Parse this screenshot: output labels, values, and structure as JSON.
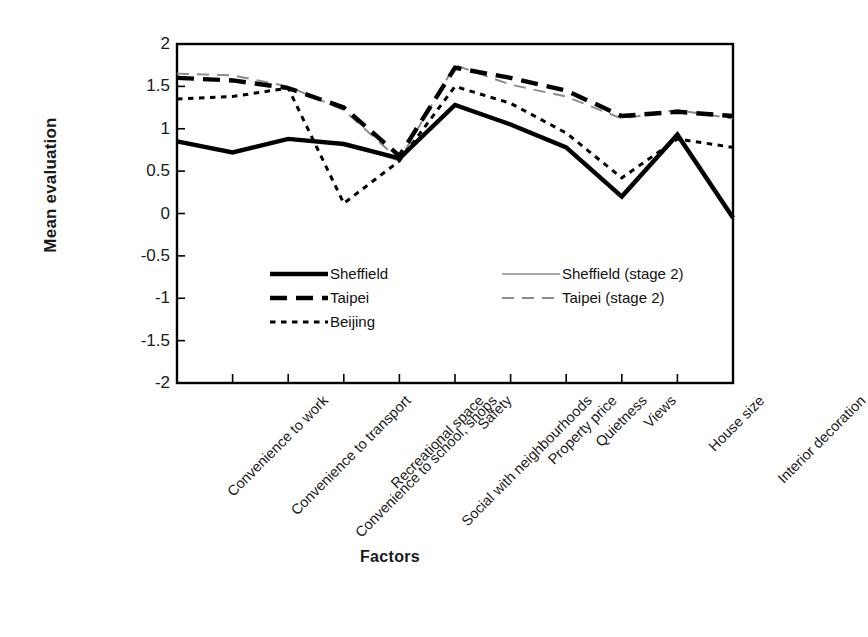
{
  "chart_data": {
    "type": "line",
    "title": "",
    "xlabel": "Factors",
    "ylabel": "Mean evaluation",
    "ylim": [
      -2,
      2
    ],
    "ytick_labels": [
      "2",
      "1.5",
      "1",
      "0.5",
      "0",
      "-0.5",
      "-1",
      "-1.5",
      "-2"
    ],
    "ytick_values": [
      2,
      1.5,
      1,
      0.5,
      0,
      -0.5,
      -1,
      -1.5,
      -2
    ],
    "grid": false,
    "legend_position": "inside-center",
    "categories": [
      "Convenience to work",
      "Convenience to transport",
      "Convenience to school, shops",
      "Recreational space",
      "Social with neighbourhoods",
      "Safety",
      "Property price",
      "Quietness",
      "Views",
      "House size",
      "Interior decoration"
    ],
    "series": [
      {
        "name": "Sheffield",
        "style": "solid-thick",
        "color": "#000000",
        "values": [
          0.85,
          0.72,
          0.88,
          0.82,
          0.65,
          1.28,
          1.05,
          0.78,
          0.2,
          0.93,
          -0.05
        ]
      },
      {
        "name": "Taipei",
        "style": "dashed-thick",
        "color": "#000000",
        "values": [
          1.6,
          1.57,
          1.48,
          1.25,
          0.68,
          1.72,
          1.6,
          1.45,
          1.15,
          1.2,
          1.15
        ]
      },
      {
        "name": "Beijing",
        "style": "dotted",
        "color": "#000000",
        "values": [
          1.35,
          1.38,
          1.48,
          0.12,
          0.62,
          1.5,
          1.3,
          0.95,
          0.42,
          0.88,
          0.78
        ]
      },
      {
        "name": "Sheffield (stage 2)",
        "style": "solid-thin",
        "color": "#8a8a8a",
        "values": [
          0.86,
          0.73,
          0.89,
          0.83,
          0.62,
          1.3,
          1.05,
          0.78,
          0.21,
          0.92,
          -0.05
        ]
      },
      {
        "name": "Taipei (stage 2)",
        "style": "dashed-thin",
        "color": "#8a8a8a",
        "values": [
          1.65,
          1.63,
          1.5,
          1.22,
          0.63,
          1.75,
          1.52,
          1.38,
          1.12,
          1.22,
          1.12
        ]
      }
    ]
  },
  "axes": {
    "y_title": "Mean evaluation",
    "x_title": "Factors"
  },
  "legend": {
    "entries": [
      {
        "label": "Sheffield",
        "column": "left"
      },
      {
        "label": "Taipei",
        "column": "left"
      },
      {
        "label": "Beijing",
        "column": "left"
      },
      {
        "label": "Sheffield (stage 2)",
        "column": "right"
      },
      {
        "label": "Taipei (stage 2)",
        "column": "right"
      }
    ]
  },
  "colors": {
    "primary": "#000000",
    "secondary": "#8a8a8a",
    "background": "#ffffff"
  }
}
